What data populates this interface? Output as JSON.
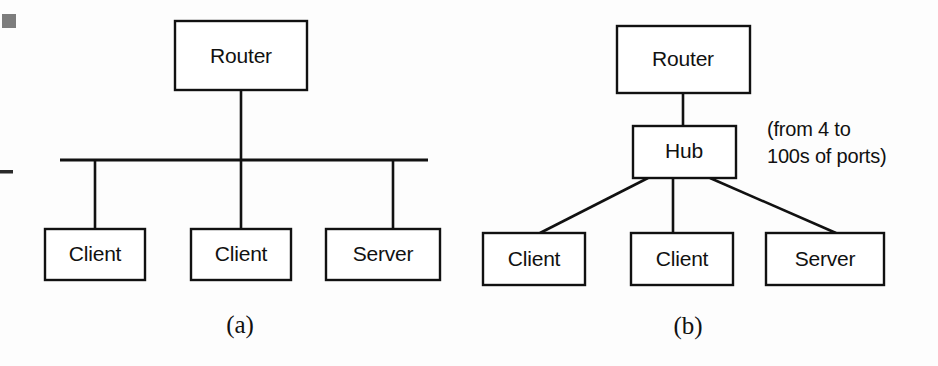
{
  "figure": {
    "background_color": "#fdfdfd",
    "line_color": "#111111",
    "box_fill": "#ffffff"
  },
  "panel_a": {
    "caption": "(a)",
    "nodes": {
      "router": "Router",
      "client_left": "Client",
      "client_middle": "Client",
      "server": "Server"
    }
  },
  "panel_b": {
    "caption": "(b)",
    "nodes": {
      "router": "Router",
      "hub": "Hub",
      "client_left": "Client",
      "client_middle": "Client",
      "server": "Server"
    },
    "annotation": {
      "line1": "(from 4 to",
      "line2": "100s of ports)"
    }
  },
  "artifacts": {
    "top_left_mark": "scan-speck",
    "left_edge_dash": "scan-dash"
  }
}
